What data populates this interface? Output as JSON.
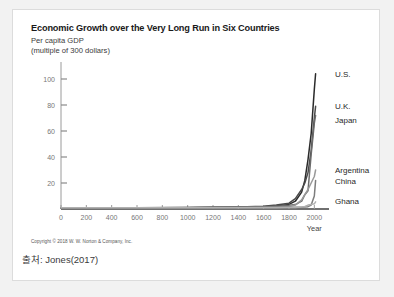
{
  "card": {
    "background": "#ffffff",
    "border_color": "#dcdcdc",
    "page_background": "#f2f2f2"
  },
  "copyright": "Copyright © 2018 W. W. Norton & Company, Inc.",
  "source_note": "출처: Jones(2017)",
  "chart_data": {
    "type": "line",
    "title": "Economic Growth over the Very Long Run in Six Countries",
    "subtitle_line1": "Per capita GDP",
    "subtitle_line2": "(multiple of 300 dollars)",
    "xlabel": "Year",
    "ylabel": "",
    "xlim": [
      0,
      2100
    ],
    "ylim": [
      0,
      110
    ],
    "grid": false,
    "legend_position": "right-inline",
    "xticks": [
      0,
      200,
      400,
      600,
      800,
      1000,
      1200,
      1400,
      1600,
      1800,
      2000
    ],
    "xticklabels": [
      "0",
      "200",
      "400",
      "600",
      "800",
      "1000",
      "1200",
      "1400",
      "1600",
      "1800",
      "2000"
    ],
    "yticks": [
      20,
      40,
      60,
      80,
      100
    ],
    "yticklabels": [
      "20",
      "40",
      "60",
      "80",
      "100"
    ],
    "series": [
      {
        "name": "U.S.",
        "color": "#2b2b2b",
        "x": [
          0,
          200,
          400,
          600,
          800,
          1000,
          1200,
          1400,
          1600,
          1700,
          1800,
          1850,
          1900,
          1925,
          1950,
          1975,
          2000,
          2010
        ],
        "values": [
          1,
          1,
          1,
          1,
          1,
          1,
          1.2,
          1.4,
          1.8,
          2.4,
          3.5,
          6,
          13,
          22,
          38,
          58,
          92,
          104
        ]
      },
      {
        "name": "U.K.",
        "color": "#4a4a4a",
        "x": [
          0,
          200,
          400,
          600,
          800,
          1000,
          1200,
          1400,
          1600,
          1700,
          1800,
          1850,
          1900,
          1925,
          1950,
          1975,
          2000,
          2010
        ],
        "values": [
          1,
          1,
          1,
          1,
          1,
          1.1,
          1.3,
          1.6,
          2.2,
          3.0,
          4.5,
          8,
          15,
          20,
          28,
          45,
          70,
          79
        ]
      },
      {
        "name": "Japan",
        "color": "#6b6b6b",
        "x": [
          0,
          200,
          400,
          600,
          800,
          1000,
          1200,
          1400,
          1600,
          1700,
          1800,
          1850,
          1900,
          1925,
          1950,
          1975,
          2000,
          2010
        ],
        "values": [
          1,
          1,
          1,
          1,
          1,
          1,
          1.1,
          1.3,
          1.7,
          2.2,
          2.8,
          3.4,
          6,
          11,
          14,
          42,
          66,
          72
        ]
      },
      {
        "name": "Argentina",
        "color": "#9a9a9a",
        "x": [
          0,
          200,
          400,
          600,
          800,
          1000,
          1200,
          1400,
          1600,
          1700,
          1800,
          1850,
          1900,
          1925,
          1950,
          1975,
          2000,
          2010
        ],
        "values": [
          1,
          1,
          1,
          1,
          1,
          1,
          1,
          1.1,
          1.3,
          1.6,
          2.0,
          3.0,
          7,
          11,
          15,
          20,
          25,
          30
        ]
      },
      {
        "name": "China",
        "color": "#7d7d7d",
        "x": [
          0,
          200,
          400,
          600,
          800,
          1000,
          1200,
          1400,
          1600,
          1700,
          1800,
          1850,
          1900,
          1925,
          1950,
          1975,
          2000,
          2010
        ],
        "values": [
          1,
          1,
          1,
          1,
          1.1,
          1.2,
          1.3,
          1.3,
          1.3,
          1.3,
          1.3,
          1.3,
          1.4,
          1.6,
          1.8,
          3,
          10,
          22
        ]
      },
      {
        "name": "Ghana",
        "color": "#b0b0b0",
        "x": [
          0,
          200,
          400,
          600,
          800,
          1000,
          1200,
          1400,
          1600,
          1700,
          1800,
          1850,
          1900,
          1925,
          1950,
          1975,
          2000,
          2010
        ],
        "values": [
          1,
          1,
          1,
          1,
          1,
          1,
          1,
          1,
          1,
          1,
          1.1,
          1.2,
          1.5,
          2.0,
          3.0,
          3.5,
          4.0,
          5.5
        ]
      }
    ],
    "series_labels": [
      {
        "name": "U.S.",
        "label": "U.S."
      },
      {
        "name": "U.K.",
        "label": "U.K."
      },
      {
        "name": "Japan",
        "label": "Japan"
      },
      {
        "name": "Argentina",
        "label": "Argentina"
      },
      {
        "name": "China",
        "label": "China"
      },
      {
        "name": "Ghana",
        "label": "Ghana"
      }
    ]
  }
}
